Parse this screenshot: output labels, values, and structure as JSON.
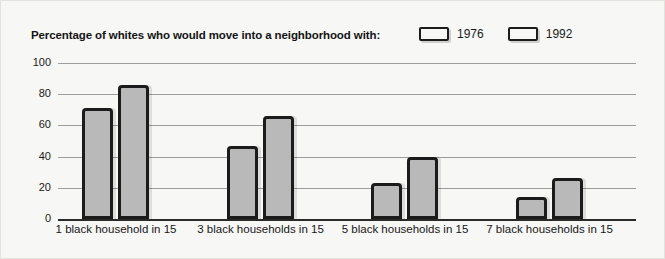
{
  "chart_data": {
    "type": "bar",
    "title": "Percentage of whites who would move into a neighborhood with:",
    "xlabel": "",
    "ylabel": "",
    "ylim": [
      0,
      100
    ],
    "yticks": [
      0,
      20,
      40,
      60,
      80,
      100
    ],
    "grid": true,
    "legend_position": "top-right",
    "categories": [
      "1 black household in 15",
      "3 black households in 15",
      "5 black households in 15",
      "7 black households in 15"
    ],
    "series": [
      {
        "name": "1976",
        "color": "#b9b9b9",
        "values": [
          71,
          47,
          23,
          14
        ]
      },
      {
        "name": "1992",
        "color": "#b9b9b9",
        "values": [
          86,
          66,
          40,
          26
        ]
      }
    ]
  },
  "colors": {
    "background": "#f7f7f5",
    "bar_fill": "#b9b9b9",
    "bar_outline": "#1b1b1b",
    "gridline": "#9d9d9d",
    "axis": "#2a2a2a",
    "text": "#161616"
  }
}
